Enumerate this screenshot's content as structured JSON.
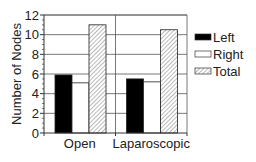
{
  "chart_data": {
    "type": "bar",
    "title": "",
    "xlabel": "",
    "ylabel": "Number of Nodes",
    "categories": [
      "Open",
      "Laparoscopic"
    ],
    "series": [
      {
        "name": "Left",
        "values": [
          5.9,
          5.5
        ],
        "fill": "#000000",
        "pattern": "solid"
      },
      {
        "name": "Right",
        "values": [
          5.1,
          5.2
        ],
        "fill": "#ffffff",
        "pattern": "solid"
      },
      {
        "name": "Total",
        "values": [
          11.0,
          10.5
        ],
        "fill": "#ffffff",
        "pattern": "hatch"
      }
    ],
    "ylim": [
      0,
      12
    ],
    "yticks": [
      0,
      2,
      4,
      6,
      8,
      10,
      12
    ],
    "ytick_labels": [
      "0",
      "2",
      "4",
      "6",
      "8",
      "10",
      "12"
    ],
    "grid": {
      "horizontal": true,
      "vertical_category_dividers": true
    },
    "legend": {
      "position": "right",
      "entries": [
        "Left",
        "Right",
        "Total"
      ]
    }
  },
  "colors": {
    "axis": "#333333",
    "grid": "#555555",
    "hatch": "#888888",
    "left_fill": "#000000",
    "right_fill": "#ffffff"
  }
}
